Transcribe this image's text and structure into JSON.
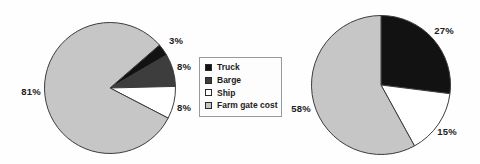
{
  "figure": {
    "background_color": "#fefefe",
    "outline_color": "#3c3c3c"
  },
  "legend": {
    "position": "center-between-pies",
    "border_color": "#9a9a9a",
    "items": [
      {
        "label": "Truck",
        "color": "#121212"
      },
      {
        "label": "Barge",
        "color": "#3d3d3d"
      },
      {
        "label": "Ship",
        "color": "#ffffff"
      },
      {
        "label": "Farm gate cost",
        "color": "#c6c6c6"
      }
    ]
  },
  "chart_data": [
    {
      "type": "pie",
      "name": "left-pie",
      "title": "",
      "start_angle_deg_clockwise_from_top": 49,
      "slices": [
        {
          "label": "Truck",
          "value": 3,
          "pct_label": "3%",
          "color": "#121212"
        },
        {
          "label": "Barge",
          "value": 8,
          "pct_label": "8%",
          "color": "#3d3d3d"
        },
        {
          "label": "Ship",
          "value": 8,
          "pct_label": "8%",
          "color": "#ffffff"
        },
        {
          "label": "Farm gate cost",
          "value": 81,
          "pct_label": "81%",
          "color": "#c6c6c6"
        }
      ],
      "legend_position": "right"
    },
    {
      "type": "pie",
      "name": "right-pie",
      "title": "",
      "start_angle_deg_clockwise_from_top": 0,
      "slices": [
        {
          "label": "Truck",
          "value": 27,
          "pct_label": "27%",
          "color": "#121212"
        },
        {
          "label": "Ship",
          "value": 15,
          "pct_label": "15%",
          "color": "#ffffff"
        },
        {
          "label": "Farm gate cost",
          "value": 58,
          "pct_label": "58%",
          "color": "#c6c6c6"
        }
      ],
      "legend_position": "none"
    }
  ]
}
